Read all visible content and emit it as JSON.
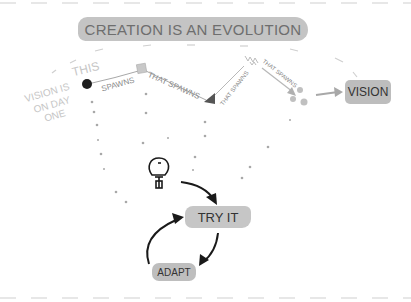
{
  "title": "CREATION IS AN EVOLUTION",
  "nodes": {
    "this": "THIS",
    "vision_day_one": [
      "VISION IS",
      "ON DAY",
      "ONE"
    ],
    "vision": "VISION",
    "try_it": "TRY IT",
    "adapt": "ADAPT"
  },
  "edges": {
    "spawns": "SPAWNS",
    "that_spawns_1": "THAT SPAWNS",
    "that_spawns_2": "THAT SPAWNS",
    "that_spawns_3": "THAT SPAWNS"
  },
  "colors": {
    "box_gray": "#c4c4c4",
    "text_dark": "#333333",
    "text_mid": "#8a8a8a",
    "text_faint": "#c6c6c6",
    "arrow_dark": "#1a1a1a",
    "line_gray": "#b0b0b0"
  }
}
